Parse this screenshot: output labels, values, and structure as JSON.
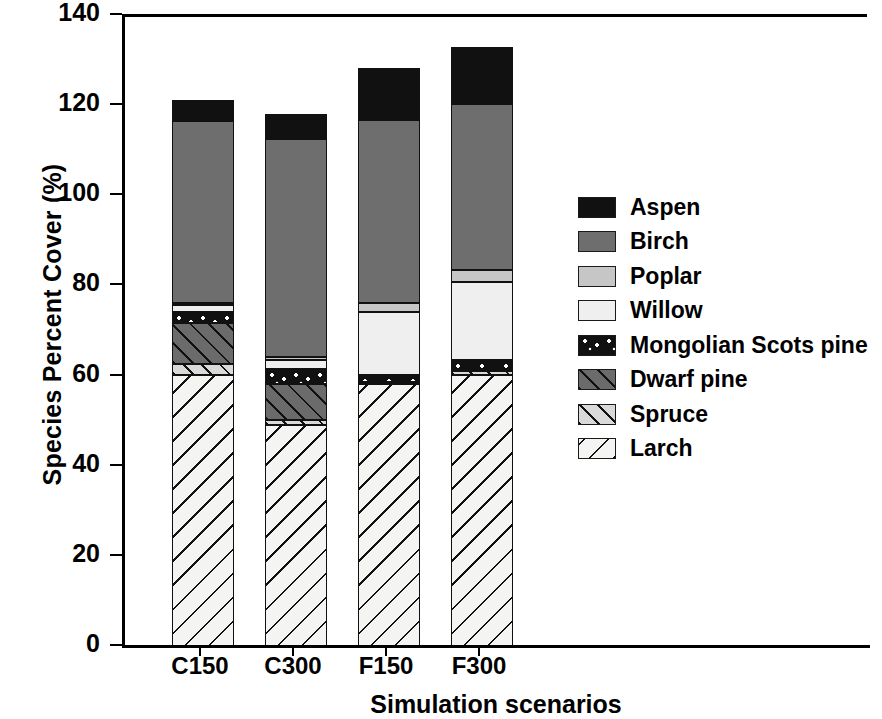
{
  "chart_data": {
    "type": "bar",
    "title": "",
    "xlabel": "Simulation scenarios",
    "ylabel": "Species Percent Cover (%)",
    "categories": [
      "C150",
      "C300",
      "F150",
      "F300"
    ],
    "ylim": [
      0,
      140
    ],
    "yticks": [
      0,
      20,
      40,
      60,
      80,
      100,
      120,
      140
    ],
    "ytick_labels": [
      "0",
      "20",
      "40",
      "60",
      "80",
      "100",
      "120",
      "140"
    ],
    "grid": false,
    "stacked": true,
    "legend_position": "right",
    "stack_order_bottom_to_top": [
      "Larch",
      "Spruce",
      "Dwarf pine",
      "Mongolian Scots pine",
      "Willow",
      "Poplar",
      "Birch",
      "Aspen"
    ],
    "series": [
      {
        "name": "Aspen",
        "values": [
          4.5,
          5.5,
          11.5,
          12.5
        ],
        "color": "#111111",
        "pattern": "solid-black"
      },
      {
        "name": "Birch",
        "values": [
          40.5,
          48.5,
          40.5,
          37.0
        ],
        "color": "#6e6e6e",
        "pattern": "solid-medium-gray"
      },
      {
        "name": "Poplar",
        "values": [
          0.5,
          0.5,
          2.0,
          2.5
        ],
        "color": "#c6c6c6",
        "pattern": "solid-light-gray"
      },
      {
        "name": "Willow",
        "values": [
          1.5,
          2.0,
          14.0,
          17.5
        ],
        "color": "#efefef",
        "pattern": "solid-very-light-gray"
      },
      {
        "name": "Mongolian Scots pine",
        "values": [
          2.5,
          3.5,
          1.5,
          2.0
        ],
        "color": "#111111",
        "pattern": "black-with-white-dots"
      },
      {
        "name": "Dwarf pine",
        "values": [
          9.0,
          8.0,
          0.3,
          0.3
        ],
        "color": "#6b6b6b",
        "pattern": "dark-gray-diagonal-hatch"
      },
      {
        "name": "Spruce",
        "values": [
          2.5,
          1.0,
          0.3,
          1.0
        ],
        "color": "#d9d9d9",
        "pattern": "light-gray-diagonal-hatch"
      },
      {
        "name": "Larch",
        "values": [
          60.5,
          49.5,
          58.5,
          60.5
        ],
        "color": "#f4f4f2",
        "pattern": "white-back-diagonal-hatch"
      }
    ],
    "totals": [
      121.5,
      118.5,
      128.6,
      133.3
    ]
  },
  "legend": {
    "items": [
      {
        "label": "Aspen",
        "swatch": "solid-black-swatch"
      },
      {
        "label": "Birch",
        "swatch": "solid-gray-swatch"
      },
      {
        "label": "Poplar",
        "swatch": "solid-light-gray-swatch"
      },
      {
        "label": "Willow",
        "swatch": "solid-near-white-swatch"
      },
      {
        "label": "Mongolian Scots pine",
        "swatch": "dotted-black-swatch"
      },
      {
        "label": "Dwarf pine",
        "swatch": "dark-hatched-swatch"
      },
      {
        "label": "Spruce",
        "swatch": "light-hatched-swatch"
      },
      {
        "label": "Larch",
        "swatch": "white-hatched-swatch"
      }
    ]
  }
}
